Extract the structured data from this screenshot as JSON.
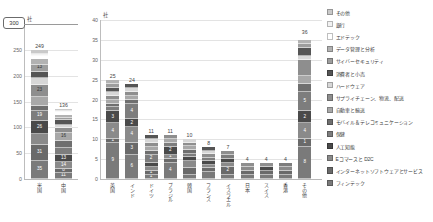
{
  "unit_label": "社",
  "callout": {
    "value": "300"
  },
  "top_strip": [
    "",
    "",
    "",
    "",
    ""
  ],
  "palette": {
    "その他": "#c9c9c9",
    "銀行": "#f2f2f2",
    "エドテック": "#ffffff",
    "データ管理と分析": "#b2b2b2",
    "サイバーセキュリティ": "#9d9d9d",
    "消費者と小売": "#555555",
    "ハードウェア": "#d7d7d7",
    "サプライチェーン、物流、配送": "#8e8e8e",
    "自動車と輸送": "#a8a8a8",
    "モバイル＆テレコミュニケーション": "#6f6f6f",
    "保健": "#7d7d7d",
    "人工知能": "#4a4a4a",
    "Eコマースと D2C": "#8a8a8a",
    "インターネットソフトウェアとサービス": "#6a6a6a",
    "フィンテック": "#7a7a7a"
  },
  "legend": {
    "items": [
      {
        "label": "その他",
        "color": "#c9c9c9"
      },
      {
        "label": "銀行",
        "color": "#f2f2f2"
      },
      {
        "label": "エドテック",
        "color": "#ffffff"
      },
      {
        "label": "データ管理と分析",
        "color": "#b2b2b2"
      },
      {
        "label": "サイバーセキュリティ",
        "color": "#9d9d9d"
      },
      {
        "label": "消費者と小売",
        "color": "#555555"
      },
      {
        "label": "ハードウェア",
        "color": "#d7d7d7"
      },
      {
        "label": "サプライチェーン、物流、配送",
        "color": "#8e8e8e"
      },
      {
        "label": "自動車と輸送",
        "color": "#a8a8a8"
      },
      {
        "label": "モバイル＆テレコミュニケーション",
        "color": "#6f6f6f"
      },
      {
        "label": "保健",
        "color": "#7d7d7d"
      },
      {
        "label": "人工知能",
        "color": "#4a4a4a"
      },
      {
        "label": "Eコマースと D2C",
        "color": "#8a8a8a"
      },
      {
        "label": "インターネットソフトウェアとサービス",
        "color": "#6a6a6a"
      },
      {
        "label": "フィンテック",
        "color": "#7a7a7a"
      }
    ]
  },
  "chart_data": [
    {
      "id": "left",
      "type": "bar",
      "stacked": true,
      "title": "",
      "xlabel": "",
      "ylabel": "社",
      "ylim": [
        0,
        300
      ],
      "yticks": [
        0,
        50,
        100,
        150,
        200,
        250
      ],
      "grid": true,
      "categories": [
        "米国",
        "中国"
      ],
      "totals": [
        249,
        136
      ],
      "series": [
        {
          "name": "フィンテック",
          "values": [
            35,
            11
          ]
        },
        {
          "name": "インターネットソフトウェアとサービス",
          "values": [
            31,
            8
          ]
        },
        {
          "name": "Eコマースと D2C",
          "values": [
            21,
            14
          ]
        },
        {
          "name": "人工知能",
          "values": [
            26,
            13
          ]
        },
        {
          "name": "保健",
          "values": [
            19,
            14
          ]
        },
        {
          "name": "モバイル＆テレコミュニケーション",
          "values": [
            9,
            13
          ]
        },
        {
          "name": "自動車と輸送",
          "values": [
            18,
            16
          ]
        },
        {
          "name": "サプライチェーン、物流、配送",
          "values": [
            23,
            9
          ]
        },
        {
          "name": "ハードウェア",
          "values": [
            14,
            7
          ]
        },
        {
          "name": "消費者と小売",
          "values": [
            12,
            10
          ]
        },
        {
          "name": "サイバーセキュリティ",
          "values": [
            13,
            4
          ]
        },
        {
          "name": "データ管理と分析",
          "values": [
            11,
            5
          ]
        },
        {
          "name": "エドテック",
          "values": [
            6,
            5
          ]
        },
        {
          "name": "銀行",
          "values": [
            5,
            3
          ]
        },
        {
          "name": "その他",
          "values": [
            6,
            4
          ]
        }
      ],
      "segment_labels": {
        "米国": {
          "フィンテック": "35",
          "インターネットソフトウェアとサービス": "31",
          "人工知能": "26",
          "保健": "19",
          "サプライチェーン、物流、配送": "23",
          "サイバーセキュリティ": "13"
        },
        "中国": {
          "フィンテック": "11",
          "Eコマースと D2C": "14",
          "人工知能": "13",
          "自動車と輸送": "16",
          "インターネットソフトウェアとサービス": "8"
        }
      }
    },
    {
      "id": "right",
      "type": "bar",
      "stacked": true,
      "title": "",
      "xlabel": "",
      "ylabel": "社",
      "ylim": [
        0,
        40
      ],
      "yticks": [
        0,
        5,
        10,
        15,
        20,
        25,
        30,
        35,
        40
      ],
      "grid": true,
      "categories": [
        "英国",
        "インド",
        "ドイツ",
        "ブラジル",
        "韓国",
        "フランス",
        "イスラエル",
        "日本",
        "スイス",
        "香港",
        "その他"
      ],
      "totals": [
        25,
        24,
        11,
        11,
        10,
        8,
        7,
        4,
        4,
        4,
        36
      ],
      "series": [
        {
          "name": "フィンテック",
          "values": [
            9,
            6,
            1,
            4,
            1,
            2,
            1,
            1,
            1,
            1,
            8
          ]
        },
        {
          "name": "インターネットソフトウェアとサービス",
          "values": [
            1,
            3,
            1,
            1,
            2,
            1,
            2,
            1,
            1,
            1,
            2
          ]
        },
        {
          "name": "Eコマースと D2C",
          "values": [
            4,
            4,
            1,
            1,
            2,
            1,
            1,
            1,
            0,
            1,
            4
          ]
        },
        {
          "name": "人工知能",
          "values": [
            3,
            2,
            1,
            2,
            1,
            1,
            1,
            0,
            1,
            0,
            3
          ]
        },
        {
          "name": "保健",
          "values": [
            1,
            4,
            2,
            1,
            1,
            1,
            1,
            0,
            0,
            1,
            5
          ]
        },
        {
          "name": "モバイル＆テレコミュニケーション",
          "values": [
            1,
            1,
            1,
            0,
            1,
            0,
            0,
            0,
            0,
            0,
            2
          ]
        },
        {
          "name": "自動車と輸送",
          "values": [
            1,
            1,
            1,
            1,
            1,
            0,
            0,
            0,
            0,
            0,
            2
          ]
        },
        {
          "name": "サプライチェーン、物流、配送",
          "values": [
            1,
            1,
            1,
            1,
            1,
            1,
            1,
            1,
            1,
            0,
            4
          ]
        },
        {
          "name": "ハードウェア",
          "values": [
            1,
            1,
            1,
            0,
            1,
            1,
            0,
            0,
            0,
            0,
            1
          ]
        },
        {
          "name": "消費者と小売",
          "values": [
            1,
            1,
            1,
            0,
            0,
            1,
            0,
            0,
            0,
            0,
            2
          ]
        },
        {
          "name": "サイバーセキュリティ",
          "values": [
            1,
            0,
            0,
            0,
            0,
            0,
            0,
            0,
            0,
            0,
            1
          ]
        },
        {
          "name": "データ管理と分析",
          "values": [
            1,
            0,
            0,
            0,
            0,
            0,
            0,
            0,
            0,
            0,
            1
          ]
        },
        {
          "name": "エドテック",
          "values": [
            0,
            0,
            0,
            0,
            0,
            0,
            0,
            0,
            0,
            0,
            1
          ]
        },
        {
          "name": "銀行",
          "values": [
            0,
            0,
            0,
            0,
            0,
            0,
            0,
            0,
            0,
            0,
            0
          ]
        },
        {
          "name": "その他",
          "values": [
            0,
            0,
            0,
            0,
            0,
            0,
            0,
            0,
            0,
            0,
            0
          ]
        }
      ],
      "segment_labels": {
        "英国": {
          "フィンテック": "9",
          "Eコマースと D2C": "4",
          "人工知能": "3",
          "インターネットソフトウェアとサービス": "1"
        },
        "インド": {
          "フィンテック": "6",
          "インターネットソフトウェアとサービス": "3",
          "Eコマースと D2C": "4",
          "人工知能": "2",
          "保健": "4"
        },
        "ドイツ": {
          "フィンテック": "1",
          "インターネットソフトウェアとサービス": "1",
          "保健": "2"
        },
        "ブラジル": {
          "フィンテック": "4",
          "人工知能": "2",
          "Eコマースと D2C": "1"
        },
        "イスラエル": {
          "インターネットソフトウェアとサービス": "2"
        },
        "その他": {
          "フィンテック": "8",
          "Eコマースと D2C": "4",
          "人工知能": "2",
          "保健": "5",
          "インターネットソフトウェアとサービス": "1"
        }
      }
    }
  ]
}
